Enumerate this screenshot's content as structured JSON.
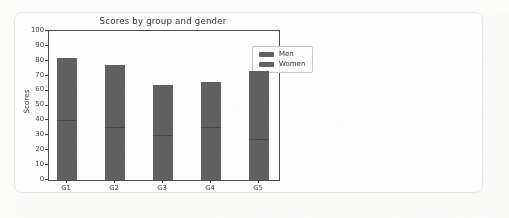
{
  "card": {
    "background": "#ffffff",
    "border_color": "#e7e7e5"
  },
  "chart_data": {
    "type": "bar",
    "stacked": true,
    "title": "Scores by group and gender",
    "xlabel": "",
    "ylabel": "Scores",
    "categories": [
      "G1",
      "G2",
      "G3",
      "G4",
      "G5"
    ],
    "series": [
      {
        "name": "Men",
        "values": [
          40,
          35,
          30,
          35,
          27
        ],
        "color": "#5e5e5e"
      },
      {
        "name": "Women",
        "values": [
          42,
          42,
          34,
          31,
          46
        ],
        "color": "#5e5e5e"
      }
    ],
    "stack_totals": [
      82,
      77,
      64,
      66,
      73
    ],
    "ylim": [
      0,
      100
    ],
    "yticks": [
      0,
      10,
      20,
      30,
      40,
      50,
      60,
      70,
      80,
      90,
      100
    ],
    "grid": false,
    "legend_position": "upper right",
    "colors": {
      "bar": "#5e5e5e",
      "segment_divider": "#454545",
      "spine": "#4b4b4b",
      "tick_text": "#383838",
      "title_text": "#2f2f2f",
      "legend_border": "#c8c8c8"
    }
  }
}
